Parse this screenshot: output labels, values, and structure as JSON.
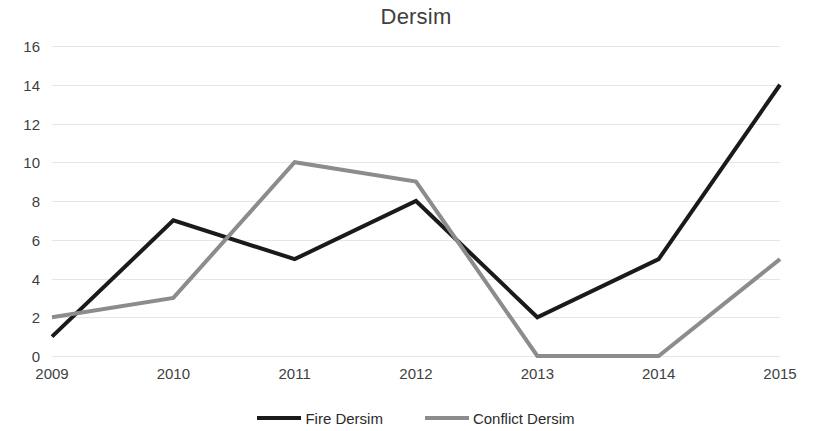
{
  "chart_data": {
    "type": "line",
    "title": "Dersim",
    "xlabel": "",
    "ylabel": "",
    "categories": [
      "2009",
      "2010",
      "2011",
      "2012",
      "2013",
      "2014",
      "2015"
    ],
    "series": [
      {
        "name": "Fire Dersim",
        "color": "#1a1a1a",
        "values": [
          1,
          7,
          5,
          8,
          2,
          5,
          14
        ]
      },
      {
        "name": "Conflict Dersim",
        "color": "#8c8c8c",
        "values": [
          2,
          3,
          10,
          9,
          0,
          0,
          5
        ]
      }
    ],
    "ylim": [
      0,
      16
    ],
    "ytick_step": 2,
    "yticks": [
      "16",
      "14",
      "12",
      "10",
      "8",
      "6",
      "4",
      "2",
      "0"
    ],
    "grid": true,
    "grid_color": "#e2e2e2",
    "legend_position": "bottom",
    "background": "#ffffff"
  }
}
